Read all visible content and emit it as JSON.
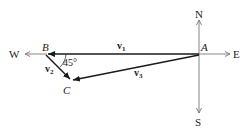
{
  "compass": {
    "north": "N",
    "south": "S",
    "east": "E",
    "west": "W"
  },
  "points": {
    "a": "A",
    "b": "B",
    "c": "C"
  },
  "vectors": {
    "v1": {
      "name": "v",
      "sub": "1"
    },
    "v2": {
      "name": "v",
      "sub": "2"
    },
    "v3": {
      "name": "v",
      "sub": "3"
    }
  },
  "angle": "45°",
  "colors": {
    "axis": "#777777",
    "vector": "#1a1a1a",
    "text": "#222222"
  }
}
